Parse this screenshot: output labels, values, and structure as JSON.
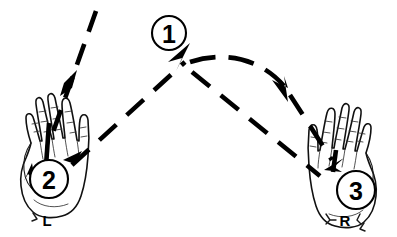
{
  "figure": {
    "type": "instructional-hand-motion-diagram",
    "background_color": "#ffffff",
    "ink_color": "#000000",
    "width": 397,
    "height": 237
  },
  "step_badges": [
    {
      "id": "badge-1",
      "label": "1",
      "cx": 169,
      "cy": 33,
      "r": 17
    },
    {
      "id": "badge-2",
      "label": "2",
      "cx": 49,
      "cy": 179,
      "r": 19
    },
    {
      "id": "badge-3",
      "label": "3",
      "cx": 356,
      "cy": 190,
      "r": 19
    }
  ],
  "hands": [
    {
      "id": "hand-left",
      "label": "L",
      "label_x": 47,
      "label_y": 220,
      "side": "left",
      "badge": "2"
    },
    {
      "id": "hand-right",
      "label": "R",
      "label_x": 345,
      "label_y": 220,
      "side": "right",
      "badge": "3"
    }
  ],
  "motion_paths": [
    {
      "id": "path-descend-to-left-hand",
      "description": "dashed line from upper right descending to the left hand palm",
      "arrowheads": 2,
      "direction": "down-left"
    },
    {
      "id": "path-left-hand-to-apex",
      "description": "dashed line rising from left hand up to the apex near badge 1",
      "arrowheads": 1,
      "direction": "up-right"
    },
    {
      "id": "path-apex-arc-right",
      "description": "curved dashed arc from apex sweeping right and down",
      "arrowheads": 1,
      "direction": "down-right"
    },
    {
      "id": "path-apex-to-right-hand",
      "description": "dashed line descending from apex to the right hand palm",
      "arrowheads": 1,
      "direction": "down-right"
    },
    {
      "id": "path-arc-to-right-hand",
      "description": "dashed line descending from the arc to the right hand palm",
      "arrowheads": 1,
      "direction": "down-left"
    }
  ]
}
